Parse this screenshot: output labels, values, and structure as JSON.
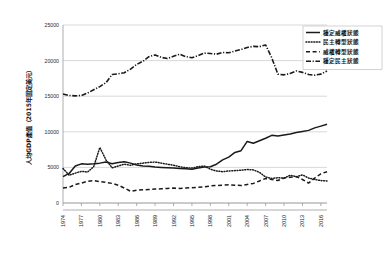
{
  "chart_data": {
    "type": "line",
    "title": "",
    "xlabel": "",
    "ylabel": "人均GDP產值（2015年固定美元）",
    "ylim": [
      0,
      25000
    ],
    "ytick_labels": [
      "0",
      "5000",
      "10000",
      "15000",
      "20000",
      "25000"
    ],
    "ytick_values": [
      0,
      5000,
      10000,
      15000,
      20000,
      25000
    ],
    "grid": true,
    "legend_position": "top-right",
    "x": [
      1974,
      1975,
      1976,
      1977,
      1978,
      1979,
      1980,
      1981,
      1982,
      1983,
      1984,
      1985,
      1986,
      1987,
      1988,
      1989,
      1990,
      1991,
      1992,
      1993,
      1994,
      1995,
      1996,
      1997,
      1998,
      1999,
      2000,
      2001,
      2002,
      2003,
      2004,
      2005,
      2006,
      2007,
      2008,
      2009,
      2010,
      2011,
      2012,
      2013,
      2014,
      2015,
      2016,
      2017
    ],
    "xtick_labels": [
      "1974",
      "1977",
      "1980",
      "1983",
      "1986",
      "1989",
      "1992",
      "1995",
      "1998",
      "2001",
      "2004",
      "2007",
      "2010",
      "2013",
      "2016"
    ],
    "xtick_values": [
      1974,
      1977,
      1980,
      1983,
      1986,
      1989,
      1992,
      1995,
      1998,
      2001,
      2004,
      2007,
      2010,
      2013,
      2016
    ],
    "series": [
      {
        "name": "穩定威權狀態",
        "style": "solid",
        "values": [
          3700,
          4150,
          5200,
          5500,
          5450,
          5500,
          5600,
          5750,
          5500,
          5700,
          5800,
          5600,
          5350,
          5200,
          5150,
          5050,
          5000,
          4950,
          4900,
          4850,
          4800,
          4750,
          4900,
          5050,
          5100,
          5450,
          6050,
          6450,
          7100,
          7350,
          8650,
          8400,
          8750,
          9100,
          9500,
          9400,
          9550,
          9700,
          9900,
          10050,
          10200,
          10550,
          10800,
          11050
        ]
      },
      {
        "name": "民主轉型狀態",
        "style": "dotted",
        "values": [
          4850,
          3900,
          4200,
          4450,
          4350,
          5100,
          7800,
          6050,
          4950,
          5200,
          5450,
          5300,
          5500,
          5600,
          5700,
          5750,
          5600,
          5450,
          5300,
          5100,
          4950,
          4900,
          5100,
          5200,
          4750,
          4500,
          4400,
          4500,
          4550,
          4600,
          4700,
          4650,
          4300,
          3650,
          3450,
          3550,
          3500,
          3900,
          3700,
          3950,
          3500,
          3300,
          3150,
          3100
        ]
      },
      {
        "name": "威權轉型狀態",
        "style": "dashed",
        "values": [
          2100,
          2200,
          2600,
          2800,
          3050,
          3150,
          3000,
          2900,
          2750,
          2500,
          2100,
          1650,
          1800,
          1850,
          1900,
          1950,
          2000,
          2050,
          2100,
          2050,
          2100,
          2150,
          2200,
          2250,
          2400,
          2450,
          2500,
          2550,
          2500,
          2450,
          2600,
          2750,
          3100,
          3450,
          3300,
          3150,
          3500,
          3600,
          3700,
          3300,
          2800,
          3500,
          4100,
          4400
        ]
      },
      {
        "name": "穩定民主狀態",
        "style": "dashdot",
        "values": [
          15300,
          15100,
          15050,
          15100,
          15450,
          15900,
          16350,
          16900,
          18050,
          18150,
          18300,
          18800,
          19450,
          19900,
          20550,
          20800,
          20450,
          20300,
          20600,
          20900,
          20550,
          20400,
          20700,
          21050,
          21000,
          20900,
          21150,
          21100,
          21350,
          21550,
          21850,
          22000,
          21950,
          22200,
          20400,
          18100,
          18000,
          18200,
          18550,
          18350,
          18050,
          17950,
          18100,
          18550
        ]
      }
    ]
  },
  "legend": {
    "items": [
      {
        "label": "穩定威權狀態",
        "style": "solid"
      },
      {
        "label": "民主轉型狀態",
        "style": "dotted"
      },
      {
        "label": "威權轉型狀態",
        "style": "dashed"
      },
      {
        "label": "穩定民主狀態",
        "style": "dashdot"
      }
    ]
  }
}
